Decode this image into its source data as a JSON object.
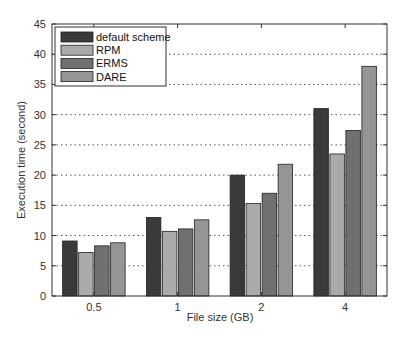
{
  "chart_data": {
    "type": "bar",
    "title": "",
    "xlabel": "File size (GB)",
    "ylabel": "Execution time (second)",
    "categories": [
      "0.5",
      "1",
      "2",
      "4"
    ],
    "series": [
      {
        "name": "default scheme",
        "color": "#3a3a3a",
        "values": [
          9.1,
          13.0,
          20.0,
          31.0
        ]
      },
      {
        "name": "RPM",
        "color": "#aaaaaa",
        "values": [
          7.2,
          10.7,
          15.3,
          23.5
        ]
      },
      {
        "name": "ERMS",
        "color": "#707070",
        "values": [
          8.3,
          11.1,
          17.0,
          27.4
        ]
      },
      {
        "name": "DARE",
        "color": "#959595",
        "values": [
          8.8,
          12.6,
          21.8,
          38.0
        ]
      }
    ],
    "ylim": [
      0,
      45
    ],
    "yticks": [
      0,
      5,
      10,
      15,
      20,
      25,
      30,
      35,
      40,
      45
    ],
    "grid": {
      "y": true,
      "style": "dotted"
    },
    "legend_position": "upper left"
  }
}
